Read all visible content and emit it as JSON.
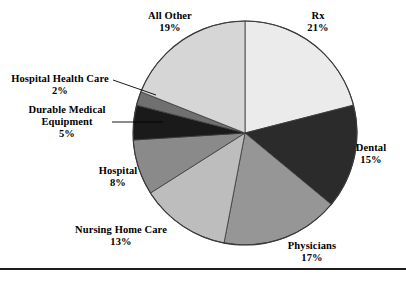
{
  "chart_data": {
    "type": "pie",
    "title": "",
    "subtitle": "",
    "xlabel": "",
    "ylabel": "",
    "legend_position": "none",
    "grid": false,
    "units": "percent",
    "total": 100,
    "start_angle_deg": 0,
    "direction": "clockwise",
    "categories": [
      "Rx",
      "Dental",
      "Physicians",
      "Nursing Home Care",
      "Hospital",
      "Durable Medical Equipment",
      "Hospital Health Care",
      "All Other"
    ],
    "values": [
      21,
      15,
      17,
      13,
      8,
      5,
      2,
      19
    ],
    "colors": [
      "#ebebeb",
      "#2b2b2b",
      "#969696",
      "#bdbdbd",
      "#8a8a8a",
      "#1a1a1a",
      "#707070",
      "#d6d6d6"
    ],
    "slices": [
      {
        "label": "Rx",
        "value": 21,
        "value_text": "21%",
        "color": "#ebebeb",
        "leader_line": false
      },
      {
        "label": "Dental",
        "value": 15,
        "value_text": "15%",
        "color": "#2b2b2b",
        "leader_line": false
      },
      {
        "label": "Physicians",
        "value": 17,
        "value_text": "17%",
        "color": "#969696",
        "leader_line": false
      },
      {
        "label": "Nursing Home Care",
        "value": 13,
        "value_text": "13%",
        "color": "#bdbdbd",
        "leader_line": false
      },
      {
        "label": "Hospital",
        "value": 8,
        "value_text": "8%",
        "color": "#8a8a8a",
        "leader_line": false
      },
      {
        "label": "Durable Medical Equipment",
        "value": 5,
        "value_text": "5%",
        "color": "#1a1a1a",
        "leader_line": true
      },
      {
        "label": "Hospital Health Care",
        "value": 2,
        "value_text": "2%",
        "color": "#707070",
        "leader_line": true
      },
      {
        "label": "All Other",
        "value": 19,
        "value_text": "19%",
        "color": "#d6d6d6",
        "leader_line": false
      }
    ]
  },
  "labels": {
    "all_other": {
      "name": "All Other",
      "pct": "19%"
    },
    "rx": {
      "name": "Rx",
      "pct": "21%"
    },
    "dental": {
      "name": "Dental",
      "pct": "15%"
    },
    "physicians": {
      "name": "Physicians",
      "pct": "17%"
    },
    "nursing_home": {
      "name": "Nursing Home Care",
      "pct": "13%"
    },
    "hospital": {
      "name": "Hospital",
      "pct": "8%"
    },
    "dme": {
      "name_line1": "Durable Medical",
      "name_line2": "Equipment",
      "pct": "5%"
    },
    "hhc": {
      "name": "Hospital Health Care",
      "pct": "2%"
    }
  },
  "style": {
    "outline_color": "#3a3a3a",
    "rule_color": "#1c1c1c",
    "background": "#ffffff"
  }
}
